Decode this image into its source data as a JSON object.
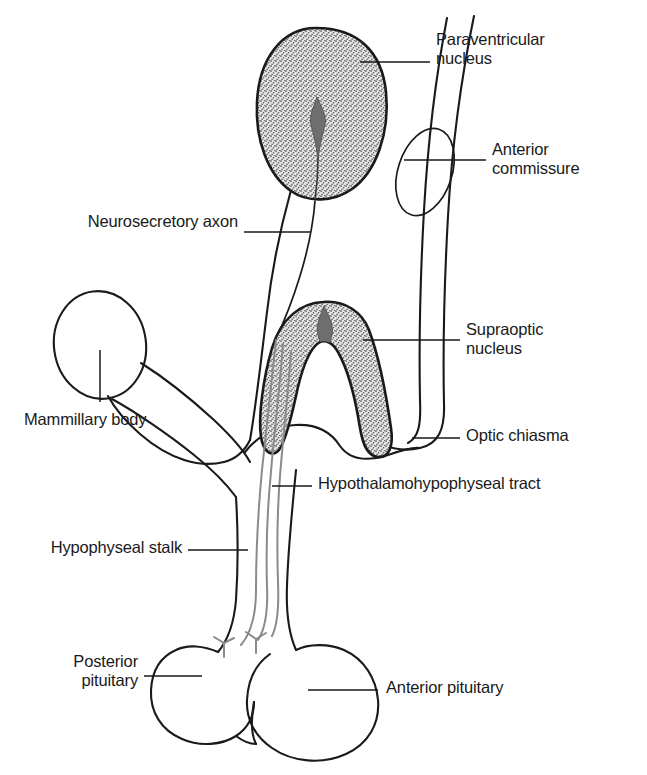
{
  "figure": {
    "type": "anatomical-diagram",
    "background_color": "#ffffff",
    "ink_color": "#1a1a1a",
    "stipple_color": "#d9d9d9",
    "core_color": "#6e6e6e",
    "axon_color": "#8a8a8a"
  },
  "labels": {
    "paraventricular_nucleus": "Paraventricular\nnucleus",
    "anterior_commissure": "Anterior\ncommissure",
    "neurosecretory_axon": "Neurosecretory axon",
    "supraoptic_nucleus": "Supraoptic\nnucleus",
    "optic_chiasma": "Optic chiasma",
    "hypothalamohypophyseal_tract": "Hypothalamohypophyseal tract",
    "mammillary_body": "Mammillary body",
    "hypophyseal_stalk": "Hypophyseal stalk",
    "posterior_pituitary": "Posterior\npituitary",
    "anterior_pituitary": "Anterior pituitary"
  },
  "structures": [
    {
      "name": "paraventricular-nucleus",
      "shading": "stippled",
      "has_core": true
    },
    {
      "name": "supraoptic-nucleus",
      "shading": "stippled",
      "has_core": true
    },
    {
      "name": "anterior-commissure",
      "shading": "outline",
      "has_core": false
    },
    {
      "name": "mammillary-body",
      "shading": "outline",
      "has_core": false
    },
    {
      "name": "optic-chiasma",
      "shading": "outline",
      "has_core": false
    },
    {
      "name": "hypophyseal-stalk",
      "shading": "outline",
      "has_core": false
    },
    {
      "name": "posterior-pituitary",
      "shading": "outline",
      "has_core": false
    },
    {
      "name": "anterior-pituitary",
      "shading": "outline",
      "has_core": false
    }
  ]
}
